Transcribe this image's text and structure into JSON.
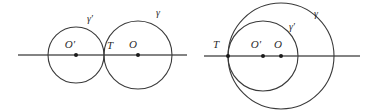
{
  "figure": {
    "stroke_color": "#3a3a3a",
    "axis_color": "#5a5a5a",
    "background": "#ffffff",
    "panels": [
      {
        "name": "externally-tangent-circles",
        "description": "Two externally tangent circles meeting at T on a common line",
        "axis": {
          "y": 55,
          "x_start": 18,
          "x_end": 187
        },
        "circles": [
          {
            "id": "gamma-prime",
            "label": "γ′",
            "cx": 76,
            "cy": 55,
            "r": 28,
            "label_x": 90,
            "label_y": 22
          },
          {
            "id": "gamma",
            "label": "γ",
            "cx": 138,
            "cy": 55,
            "r": 34,
            "label_x": 158,
            "label_y": 16
          }
        ],
        "points": [
          {
            "id": "O-prime",
            "label": "O′",
            "x": 76,
            "y": 55,
            "label_x": 70,
            "label_y": 48,
            "dot": true
          },
          {
            "id": "T",
            "label": "T",
            "x": 104,
            "y": 55,
            "label_x": 108,
            "label_y": 49,
            "dot": false
          },
          {
            "id": "O",
            "label": "O",
            "x": 138,
            "y": 55,
            "label_x": 133,
            "label_y": 48,
            "dot": true
          }
        ]
      },
      {
        "name": "internally-tangent-circles",
        "description": "Two internally tangent circles meeting at T on a common line",
        "axis": {
          "y": 56,
          "x_start": 204,
          "x_end": 360
        },
        "circles": [
          {
            "id": "gamma",
            "label": "γ",
            "cx": 281,
            "cy": 56,
            "r": 53,
            "label_x": 316,
            "label_y": 17
          },
          {
            "id": "gamma-prime",
            "label": "γ′",
            "cx": 263,
            "cy": 56,
            "r": 35,
            "label_x": 292,
            "label_y": 30
          }
        ],
        "points": [
          {
            "id": "T",
            "label": "T",
            "x": 228,
            "y": 56,
            "label_x": 216,
            "label_y": 48,
            "dot": true
          },
          {
            "id": "O-prime",
            "label": "O′",
            "x": 263,
            "y": 56,
            "label_x": 256,
            "label_y": 48,
            "dot": true
          },
          {
            "id": "O",
            "label": "O",
            "x": 281,
            "y": 56,
            "label_x": 276,
            "label_y": 48,
            "dot": true
          }
        ]
      }
    ]
  }
}
